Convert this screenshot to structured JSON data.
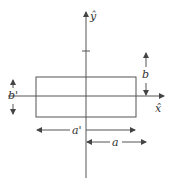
{
  "diagram": {
    "colors": {
      "line": "#555555",
      "text": "#333333",
      "background": "#ffffff"
    },
    "axes": {
      "x_label": "x̂",
      "y_label": "ŷ"
    },
    "rectangle": {
      "description": "rectangle centered on origin"
    },
    "dimensions": {
      "a_prime": "a'",
      "a": "a",
      "b_prime": "b'",
      "b": "b"
    }
  }
}
